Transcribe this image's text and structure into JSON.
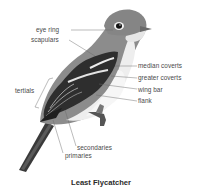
{
  "diagram": {
    "title": "Least Flycatcher",
    "labels": {
      "eye_ring": "eye ring",
      "scapulars": "scapulars",
      "median_coverts": "median coverts",
      "greater_coverts": "greater coverts",
      "wing_bar": "wing bar",
      "flank": "flank",
      "tertials": "tertials",
      "secondaries": "secondaries",
      "primaries": "primaries"
    },
    "colors": {
      "background": "#ffffff",
      "label_text": "#4a4a4a",
      "leader_line": "#6a6a6a",
      "upperparts": "#8a8a8a",
      "wing_dark": "#2e2e2e",
      "wing_bar": "#e8e8e8",
      "underparts": "#f0f0f0",
      "title": "#2b2b2b"
    }
  }
}
